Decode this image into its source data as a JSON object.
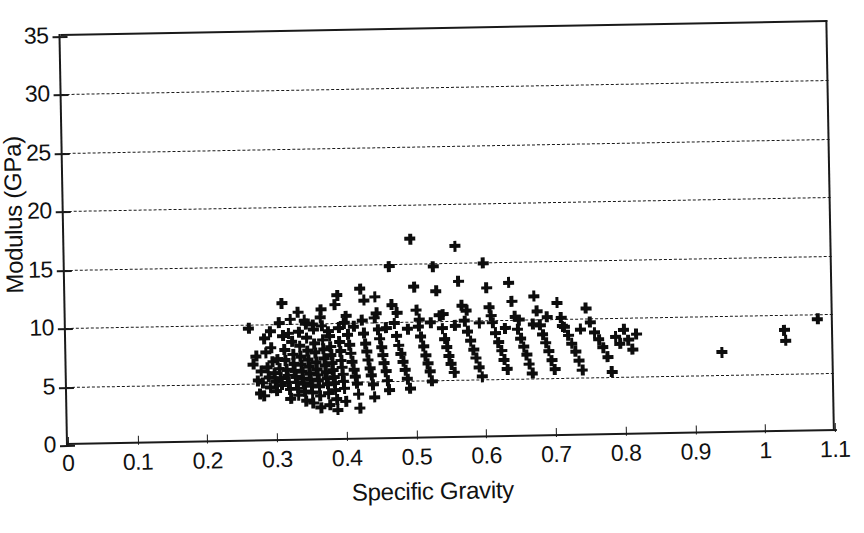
{
  "chart_data": {
    "type": "scatter",
    "title": "",
    "xlabel": "Specific Gravity",
    "ylabel": "Modulus (GPa)",
    "xlim": [
      0,
      1.1
    ],
    "ylim": [
      0,
      35
    ],
    "xticks": [
      "0",
      "0.1",
      "0.2",
      "0.3",
      "0.4",
      "0.5",
      "0.6",
      "0.7",
      "0.8",
      "0.9",
      "1",
      "1.1"
    ],
    "xtick_values": [
      0,
      0.1,
      0.2,
      0.3,
      0.4,
      0.5,
      0.6,
      0.7,
      0.8,
      0.9,
      1.0,
      1.1
    ],
    "yticks": [
      "0",
      "5",
      "10",
      "15",
      "20",
      "25",
      "30",
      "35"
    ],
    "ytick_values": [
      0,
      5,
      10,
      15,
      20,
      25,
      30,
      35
    ],
    "grid": "horizontal-dashed",
    "gridline_values": [
      5,
      10,
      15,
      20,
      25,
      30
    ],
    "legend": "none",
    "marker": "plus",
    "marker_color": "#0d0d0d",
    "n_points": 242,
    "points": [
      [
        0.262,
        9.7
      ],
      [
        0.268,
        6.6
      ],
      [
        0.272,
        7.3
      ],
      [
        0.274,
        5.2
      ],
      [
        0.277,
        4.1
      ],
      [
        0.279,
        6.0
      ],
      [
        0.281,
        5.0
      ],
      [
        0.283,
        3.9
      ],
      [
        0.286,
        7.6
      ],
      [
        0.288,
        6.3
      ],
      [
        0.29,
        5.5
      ],
      [
        0.292,
        4.6
      ],
      [
        0.294,
        8.0
      ],
      [
        0.296,
        6.8
      ],
      [
        0.298,
        5.8
      ],
      [
        0.3,
        5.1
      ],
      [
        0.301,
        4.3
      ],
      [
        0.303,
        7.0
      ],
      [
        0.305,
        6.2
      ],
      [
        0.307,
        5.4
      ],
      [
        0.308,
        4.8
      ],
      [
        0.31,
        11.8
      ],
      [
        0.311,
        9.0
      ],
      [
        0.313,
        7.8
      ],
      [
        0.314,
        6.9
      ],
      [
        0.316,
        6.1
      ],
      [
        0.317,
        5.6
      ],
      [
        0.318,
        5.0
      ],
      [
        0.32,
        4.4
      ],
      [
        0.321,
        3.6
      ],
      [
        0.322,
        10.4
      ],
      [
        0.324,
        8.5
      ],
      [
        0.325,
        7.4
      ],
      [
        0.326,
        6.6
      ],
      [
        0.327,
        6.0
      ],
      [
        0.329,
        5.5
      ],
      [
        0.33,
        5.0
      ],
      [
        0.331,
        4.5
      ],
      [
        0.332,
        3.9
      ],
      [
        0.334,
        9.3
      ],
      [
        0.335,
        8.1
      ],
      [
        0.336,
        7.2
      ],
      [
        0.337,
        6.5
      ],
      [
        0.338,
        5.9
      ],
      [
        0.339,
        5.3
      ],
      [
        0.34,
        4.9
      ],
      [
        0.341,
        4.2
      ],
      [
        0.343,
        3.4
      ],
      [
        0.344,
        10.0
      ],
      [
        0.345,
        8.8
      ],
      [
        0.346,
        7.7
      ],
      [
        0.347,
        6.9
      ],
      [
        0.348,
        6.3
      ],
      [
        0.349,
        5.7
      ],
      [
        0.35,
        5.2
      ],
      [
        0.351,
        4.7
      ],
      [
        0.352,
        4.1
      ],
      [
        0.353,
        3.2
      ],
      [
        0.355,
        9.5
      ],
      [
        0.356,
        8.3
      ],
      [
        0.357,
        7.5
      ],
      [
        0.358,
        6.7
      ],
      [
        0.359,
        6.1
      ],
      [
        0.36,
        5.6
      ],
      [
        0.361,
        5.1
      ],
      [
        0.362,
        4.6
      ],
      [
        0.363,
        3.8
      ],
      [
        0.364,
        2.8
      ],
      [
        0.366,
        11.2
      ],
      [
        0.367,
        9.8
      ],
      [
        0.368,
        8.6
      ],
      [
        0.369,
        7.8
      ],
      [
        0.37,
        7.0
      ],
      [
        0.371,
        6.4
      ],
      [
        0.372,
        5.8
      ],
      [
        0.373,
        5.3
      ],
      [
        0.374,
        4.8
      ],
      [
        0.375,
        4.0
      ],
      [
        0.377,
        3.0
      ],
      [
        0.378,
        8.9
      ],
      [
        0.379,
        8.0
      ],
      [
        0.38,
        7.3
      ],
      [
        0.381,
        6.6
      ],
      [
        0.382,
        6.0
      ],
      [
        0.383,
        5.4
      ],
      [
        0.384,
        4.9
      ],
      [
        0.385,
        4.3
      ],
      [
        0.387,
        3.5
      ],
      [
        0.388,
        2.6
      ],
      [
        0.39,
        12.4
      ],
      [
        0.391,
        9.6
      ],
      [
        0.392,
        8.4
      ],
      [
        0.393,
        7.6
      ],
      [
        0.394,
        6.8
      ],
      [
        0.395,
        6.2
      ],
      [
        0.396,
        5.6
      ],
      [
        0.397,
        5.0
      ],
      [
        0.398,
        4.4
      ],
      [
        0.4,
        3.3
      ],
      [
        0.402,
        10.6
      ],
      [
        0.404,
        9.0
      ],
      [
        0.406,
        8.1
      ],
      [
        0.408,
        7.4
      ],
      [
        0.41,
        6.7
      ],
      [
        0.412,
        6.0
      ],
      [
        0.414,
        5.4
      ],
      [
        0.416,
        4.8
      ],
      [
        0.418,
        3.9
      ],
      [
        0.42,
        2.7
      ],
      [
        0.423,
        12.9
      ],
      [
        0.425,
        10.2
      ],
      [
        0.427,
        9.1
      ],
      [
        0.429,
        8.2
      ],
      [
        0.431,
        7.5
      ],
      [
        0.433,
        6.8
      ],
      [
        0.435,
        6.1
      ],
      [
        0.437,
        5.5
      ],
      [
        0.439,
        4.7
      ],
      [
        0.441,
        3.6
      ],
      [
        0.444,
        12.2
      ],
      [
        0.446,
        10.8
      ],
      [
        0.448,
        9.4
      ],
      [
        0.45,
        8.6
      ],
      [
        0.452,
        7.9
      ],
      [
        0.454,
        7.2
      ],
      [
        0.456,
        6.5
      ],
      [
        0.458,
        5.8
      ],
      [
        0.46,
        5.0
      ],
      [
        0.462,
        4.2
      ],
      [
        0.465,
        14.8
      ],
      [
        0.468,
        11.5
      ],
      [
        0.471,
        9.9
      ],
      [
        0.474,
        8.8
      ],
      [
        0.477,
        8.0
      ],
      [
        0.48,
        7.3
      ],
      [
        0.483,
        6.6
      ],
      [
        0.486,
        5.9
      ],
      [
        0.489,
        5.1
      ],
      [
        0.492,
        4.3
      ],
      [
        0.496,
        17.1
      ],
      [
        0.5,
        13.0
      ],
      [
        0.503,
        11.0
      ],
      [
        0.506,
        9.6
      ],
      [
        0.509,
        8.7
      ],
      [
        0.512,
        7.9
      ],
      [
        0.515,
        7.1
      ],
      [
        0.518,
        6.4
      ],
      [
        0.521,
        5.7
      ],
      [
        0.524,
        4.9
      ],
      [
        0.528,
        14.7
      ],
      [
        0.532,
        12.6
      ],
      [
        0.536,
        10.5
      ],
      [
        0.54,
        9.4
      ],
      [
        0.543,
        8.5
      ],
      [
        0.546,
        7.8
      ],
      [
        0.549,
        7.0
      ],
      [
        0.552,
        6.3
      ],
      [
        0.556,
        5.6
      ],
      [
        0.56,
        16.4
      ],
      [
        0.564,
        13.4
      ],
      [
        0.568,
        11.3
      ],
      [
        0.572,
        10.0
      ],
      [
        0.576,
        9.1
      ],
      [
        0.58,
        8.3
      ],
      [
        0.584,
        7.5
      ],
      [
        0.588,
        6.8
      ],
      [
        0.592,
        6.0
      ],
      [
        0.596,
        5.2
      ],
      [
        0.6,
        14.9
      ],
      [
        0.604,
        12.8
      ],
      [
        0.608,
        11.1
      ],
      [
        0.612,
        9.8
      ],
      [
        0.616,
        8.9
      ],
      [
        0.62,
        8.1
      ],
      [
        0.624,
        7.4
      ],
      [
        0.628,
        6.6
      ],
      [
        0.632,
        5.8
      ],
      [
        0.636,
        13.2
      ],
      [
        0.64,
        11.6
      ],
      [
        0.644,
        10.3
      ],
      [
        0.648,
        9.2
      ],
      [
        0.652,
        8.4
      ],
      [
        0.656,
        7.7
      ],
      [
        0.66,
        7.0
      ],
      [
        0.664,
        6.2
      ],
      [
        0.668,
        5.4
      ],
      [
        0.672,
        12.0
      ],
      [
        0.676,
        10.7
      ],
      [
        0.68,
        9.5
      ],
      [
        0.684,
        8.7
      ],
      [
        0.688,
        8.0
      ],
      [
        0.692,
        7.3
      ],
      [
        0.696,
        6.5
      ],
      [
        0.7,
        5.7
      ],
      [
        0.705,
        11.4
      ],
      [
        0.71,
        10.1
      ],
      [
        0.715,
        9.3
      ],
      [
        0.72,
        8.6
      ],
      [
        0.725,
        7.9
      ],
      [
        0.73,
        7.2
      ],
      [
        0.735,
        6.4
      ],
      [
        0.74,
        5.6
      ],
      [
        0.746,
        10.9
      ],
      [
        0.752,
        9.7
      ],
      [
        0.758,
        8.8
      ],
      [
        0.764,
        8.2
      ],
      [
        0.77,
        7.5
      ],
      [
        0.776,
        6.7
      ],
      [
        0.782,
        5.4
      ],
      [
        0.788,
        8.4
      ],
      [
        0.794,
        7.8
      ],
      [
        0.8,
        9.0
      ],
      [
        0.806,
        8.1
      ],
      [
        0.812,
        7.3
      ],
      [
        0.818,
        8.6
      ],
      [
        0.284,
        8.8
      ],
      [
        0.293,
        9.4
      ],
      [
        0.306,
        10.1
      ],
      [
        0.319,
        9.2
      ],
      [
        0.333,
        11.0
      ],
      [
        0.342,
        10.3
      ],
      [
        0.354,
        9.9
      ],
      [
        0.365,
        10.5
      ],
      [
        0.376,
        9.3
      ],
      [
        0.386,
        11.6
      ],
      [
        0.399,
        10.0
      ],
      [
        0.413,
        9.7
      ],
      [
        0.428,
        11.9
      ],
      [
        0.443,
        10.4
      ],
      [
        0.459,
        9.5
      ],
      [
        0.475,
        10.8
      ],
      [
        0.49,
        9.4
      ],
      [
        0.507,
        10.2
      ],
      [
        0.523,
        9.9
      ],
      [
        0.541,
        10.6
      ],
      [
        0.558,
        9.6
      ],
      [
        0.575,
        10.9
      ],
      [
        0.593,
        9.8
      ],
      [
        0.61,
        10.4
      ],
      [
        0.63,
        9.3
      ],
      [
        0.65,
        10.0
      ],
      [
        0.67,
        9.6
      ],
      [
        0.69,
        10.2
      ],
      [
        0.712,
        9.4
      ],
      [
        0.738,
        9.1
      ],
      [
        0.94,
        6.9
      ],
      [
        1.03,
        8.7
      ],
      [
        1.032,
        7.8
      ],
      [
        1.078,
        9.6
      ]
    ]
  },
  "axis": {
    "x_title": "Specific Gravity",
    "y_title": "Modulus (GPa)"
  }
}
